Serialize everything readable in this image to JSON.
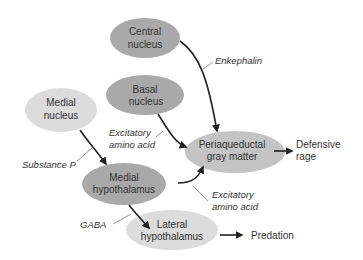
{
  "diagram": {
    "type": "flow",
    "colors": {
      "dark_node": "#a9a9a9",
      "light_node": "#d9d9d9",
      "mid_node": "#c2c2c2",
      "arrow": "#222222",
      "leader": "#777777",
      "text": "#333333"
    },
    "nodes": {
      "central": {
        "line1": "Central",
        "line2": "nucleus"
      },
      "basal": {
        "line1": "Basal",
        "line2": "nucleus"
      },
      "medial_nucleus": {
        "line1": "Medial",
        "line2": "nucleus"
      },
      "pag": {
        "line1": "Periaqueductal",
        "line2": "gray matter"
      },
      "medial_hypo": {
        "line1": "Medial",
        "line2": "hypothalamus"
      },
      "lateral_hypo": {
        "line1": "Lateral",
        "line2": "hypothalamus"
      }
    },
    "labels": {
      "enkephalin": "Enkephalin",
      "eaa1_line1": "Excitatory",
      "eaa1_line2": "amino acid",
      "substance_p": "Substance P",
      "eaa2_line1": "Excitatory",
      "eaa2_line2": "amino acid",
      "gaba": "GABA"
    },
    "outputs": {
      "defensive_line1": "Defensive",
      "defensive_line2": "rage",
      "predation": "Predation"
    }
  }
}
